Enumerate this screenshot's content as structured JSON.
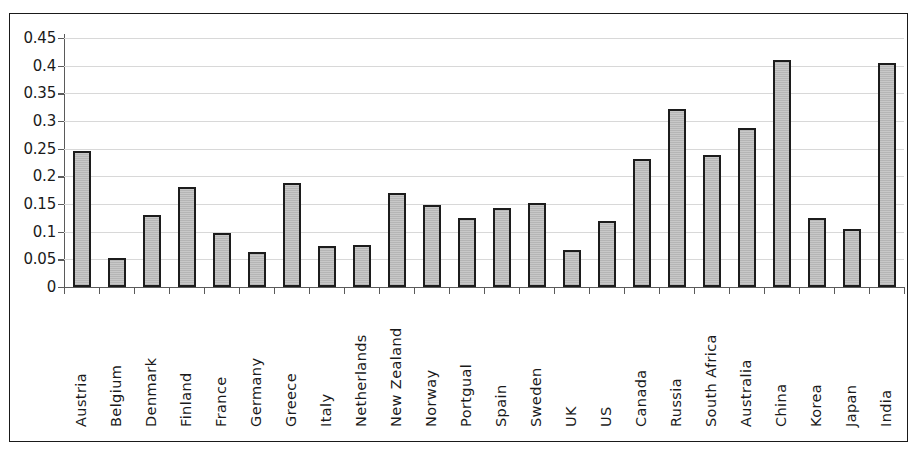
{
  "chart_data": {
    "type": "bar",
    "title": "",
    "xlabel": "",
    "ylabel": "",
    "ylim": [
      0,
      0.45
    ],
    "ytick_step": 0.05,
    "grid": true,
    "legend": null,
    "yticks": [
      "0.45",
      "0.4",
      "0.35",
      "0.3",
      "0.25",
      "0.2",
      "0.15",
      "0.1",
      "0.05",
      "0"
    ],
    "ytick_values": [
      0.45,
      0.4,
      0.35,
      0.3,
      0.25,
      0.2,
      0.15,
      0.1,
      0.05,
      0
    ],
    "categories": [
      "Austria",
      "Belgium",
      "Denmark",
      "Finland",
      "France",
      "Germany",
      "Greece",
      "Italy",
      "Netherlands",
      "New Zealand",
      "Norway",
      "Portgual",
      "Spain",
      "Sweden",
      "UK",
      "US",
      "Canada",
      "Russia",
      "South Africa",
      "Australia",
      "China",
      "Korea",
      "Japan",
      "India"
    ],
    "values": [
      0.245,
      0.053,
      0.131,
      0.18,
      0.097,
      0.063,
      0.188,
      0.075,
      0.076,
      0.17,
      0.148,
      0.124,
      0.142,
      0.151,
      0.067,
      0.12,
      0.232,
      0.322,
      0.239,
      0.288,
      0.41,
      0.124,
      0.104,
      0.404
    ],
    "colors": {
      "bar_fill": "#c8c8c8",
      "bar_border": "#1c1c1c",
      "gridline": "#d8d8d8",
      "axis": "#5a5a5a",
      "frame": "#1a1a1a",
      "text": "#1a1a1a",
      "background": "#ffffff"
    }
  }
}
